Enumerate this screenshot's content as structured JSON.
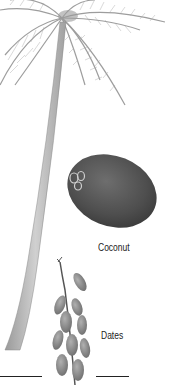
{
  "illustration": {
    "subject": "Coconut palm with coconut and dates",
    "labels": {
      "coconut": "Coconut",
      "dates": "Dates"
    },
    "colors": {
      "background": "#ffffff",
      "frond": "#8a8a8a",
      "trunk": "#b5b5b5",
      "coconut": "#5a5a5a",
      "dates": "#8c8c8c",
      "text": "#222222"
    },
    "scale_bars": [
      {
        "position": "left"
      },
      {
        "position": "right"
      }
    ]
  }
}
